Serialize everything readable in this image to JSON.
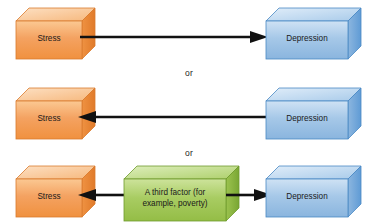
{
  "diagram": {
    "title_text": "",
    "background_color": "#ffffff",
    "connector_color": "#111111",
    "text_color": "#1a1a1a",
    "rows": [
      {
        "id": "row-stress-causes-depression",
        "nodes": [
          {
            "id": "stress-1",
            "label": "Stress",
            "color_key": "orange"
          },
          {
            "id": "depression-1",
            "label": "Depression",
            "color_key": "blue"
          }
        ],
        "arrows": [
          {
            "id": "arrow-stress-to-depression",
            "direction": "right"
          }
        ]
      },
      {
        "id": "row-depression-causes-stress",
        "nodes": [
          {
            "id": "stress-2",
            "label": "Stress",
            "color_key": "orange"
          },
          {
            "id": "depression-2",
            "label": "Depression",
            "color_key": "blue"
          }
        ],
        "arrows": [
          {
            "id": "arrow-depression-to-stress",
            "direction": "left"
          }
        ]
      },
      {
        "id": "row-third-factor",
        "nodes": [
          {
            "id": "stress-3",
            "label": "Stress",
            "color_key": "orange"
          },
          {
            "id": "third-factor",
            "label_line1": "A third factor (for",
            "label_line2": "example, poverty)",
            "color_key": "green"
          },
          {
            "id": "depression-3",
            "label": "Depression",
            "color_key": "blue"
          }
        ],
        "arrows": [
          {
            "id": "arrow-third-factor-to-stress",
            "direction": "left"
          },
          {
            "id": "arrow-third-factor-to-depression",
            "direction": "right"
          }
        ]
      }
    ],
    "separators": [
      {
        "id": "or-separator-1",
        "label": "or"
      },
      {
        "id": "or-separator-2",
        "label": "or"
      }
    ],
    "colors": {
      "orange": {
        "front": "#f4a261",
        "front_light": "#fbc38f",
        "top": "#fbd3ae",
        "side": "#e07f33",
        "stroke": "#d97b2e"
      },
      "blue": {
        "front": "#a6c8e8",
        "front_light": "#cfe2f4",
        "top": "#cfe3f5",
        "side": "#5f9bd5",
        "stroke": "#4a89c4"
      },
      "green": {
        "front": "#a8cc62",
        "front_light": "#cde39b",
        "top": "#cfe4a0",
        "side": "#79a633",
        "stroke": "#6f9b2d"
      }
    }
  }
}
